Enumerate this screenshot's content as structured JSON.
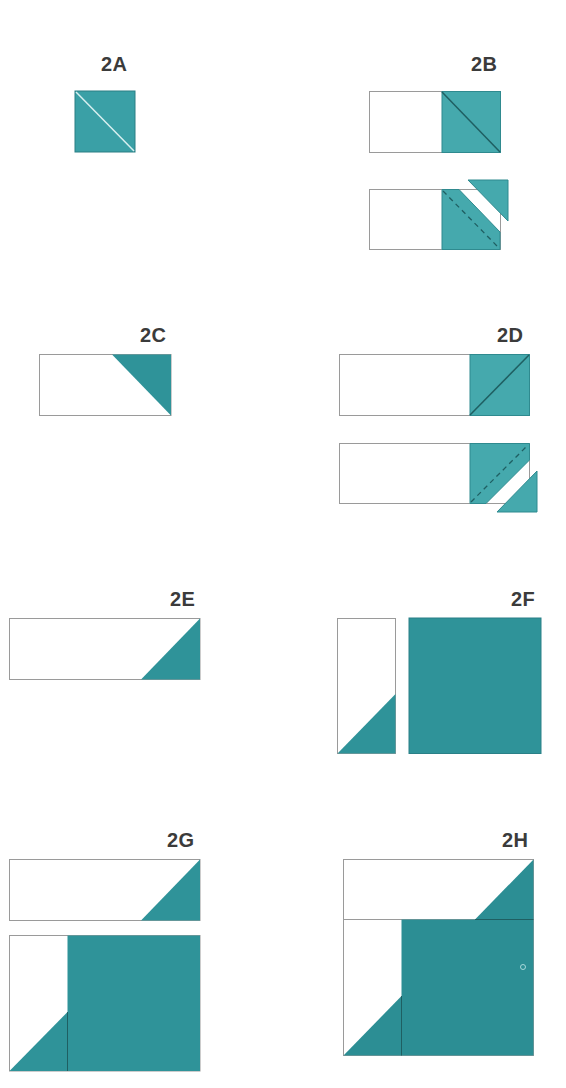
{
  "colors": {
    "teal_light": "#3fa2a7",
    "teal": "#2f9299",
    "teal_dark": "#2a878d",
    "outline": "#9a9a9a",
    "seam": "#1f5f62",
    "label": "#3b3b3b"
  },
  "panels": [
    {
      "id": "2A",
      "label": "2A",
      "description": "Half-square triangle unit: teal square with light diagonal seam"
    },
    {
      "id": "2B",
      "label": "2B",
      "description": "White rectangle with teal square on right, diagonal sewn; trimmed with cut-off triangle"
    },
    {
      "id": "2C",
      "label": "2C",
      "description": "White rectangle with teal triangle in upper-right corner"
    },
    {
      "id": "2D",
      "label": "2D",
      "description": "White rectangle with teal square on right, opposite diagonal; trimmed with cut-off triangle"
    },
    {
      "id": "2E",
      "label": "2E",
      "description": "Long white rectangle with teal triangle in lower-right corner"
    },
    {
      "id": "2F",
      "label": "2F",
      "description": "Narrow white rectangle with teal triangle at bottom-left, beside large teal square"
    },
    {
      "id": "2G",
      "label": "2G",
      "description": "Flying-geese strip above narrow strip joined to large teal square"
    },
    {
      "id": "2H",
      "label": "2H",
      "description": "Assembled block combining strip and square units"
    }
  ]
}
